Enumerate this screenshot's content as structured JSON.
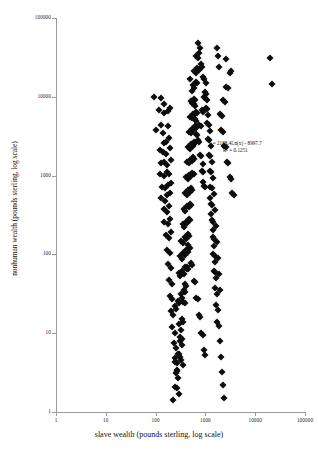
{
  "chart_data": {
    "type": "scatter",
    "title": "",
    "xlabel": "slave wealth (pounds sterling, log scale)",
    "ylabel": "nonhuman wealth (pounds sterling, log scale)",
    "xscale": "log",
    "yscale": "log",
    "xlim": [
      1,
      100000
    ],
    "ylim": [
      1,
      100000
    ],
    "xticks": [
      "1",
      "10",
      "100",
      "1000",
      "10000",
      "100000"
    ],
    "yticks": [
      "1",
      "10",
      "100",
      "1000",
      "10000",
      "100000"
    ],
    "grid": false,
    "legend": null,
    "marker": "diamond",
    "marker_color": "#0d0d0d",
    "annotations": [
      {
        "name": "regression-equation",
        "line1": "y = 2188.4Ln(x) - 8997.7",
        "line2": "R² = 0.1251",
        "x": 4000,
        "y": 2300
      }
    ],
    "regression": {
      "equation": "y = 2188.4Ln(x) - 8997.7",
      "slope_coefficient": 2188.4,
      "intercept": -8997.7,
      "r_squared": 0.1251,
      "form": "logarithmic"
    },
    "points": [
      [
        900,
        1400
      ],
      [
        900,
        830
      ],
      [
        95,
        9800
      ],
      [
        130,
        9600
      ],
      [
        150,
        8200
      ],
      [
        115,
        6800
      ],
      [
        150,
        6300
      ],
      [
        175,
        6600
      ],
      [
        195,
        7300
      ],
      [
        100,
        3800
      ],
      [
        130,
        4400
      ],
      [
        140,
        3500
      ],
      [
        175,
        4200
      ],
      [
        150,
        2600
      ],
      [
        165,
        2700
      ],
      [
        185,
        3000
      ],
      [
        120,
        2100
      ],
      [
        138,
        2000
      ],
      [
        160,
        1900
      ],
      [
        195,
        2250
      ],
      [
        128,
        1450
      ],
      [
        150,
        1500
      ],
      [
        170,
        1380
      ],
      [
        205,
        1600
      ],
      [
        120,
        1050
      ],
      [
        145,
        980
      ],
      [
        168,
        1120
      ],
      [
        190,
        1050
      ],
      [
        135,
        720
      ],
      [
        158,
        690
      ],
      [
        178,
        760
      ],
      [
        200,
        810
      ],
      [
        130,
        520
      ],
      [
        152,
        480
      ],
      [
        172,
        560
      ],
      [
        196,
        600
      ],
      [
        145,
        380
      ],
      [
        168,
        350
      ],
      [
        188,
        410
      ],
      [
        150,
        260
      ],
      [
        175,
        240
      ],
      [
        198,
        280
      ],
      [
        160,
        175
      ],
      [
        182,
        160
      ],
      [
        205,
        190
      ],
      [
        170,
        115
      ],
      [
        192,
        105
      ],
      [
        180,
        75
      ],
      [
        200,
        68
      ],
      [
        185,
        48
      ],
      [
        210,
        42
      ],
      [
        195,
        30
      ],
      [
        215,
        27
      ],
      [
        205,
        19
      ],
      [
        228,
        17
      ],
      [
        218,
        12
      ],
      [
        240,
        10
      ],
      [
        230,
        7.5
      ],
      [
        252,
        6.5
      ],
      [
        242,
        4.8
      ],
      [
        265,
        4.2
      ],
      [
        255,
        3.1
      ],
      [
        278,
        2.7
      ],
      [
        268,
        2.0
      ],
      [
        290,
        1.7
      ],
      [
        300,
        13
      ],
      [
        320,
        11
      ],
      [
        310,
        8
      ],
      [
        335,
        7
      ],
      [
        250,
        4.3
      ],
      [
        270,
        3.4
      ],
      [
        285,
        5.5
      ],
      [
        305,
        5.0
      ],
      [
        330,
        4.6
      ],
      [
        355,
        4.0
      ],
      [
        240,
        22
      ],
      [
        262,
        20
      ],
      [
        280,
        26
      ],
      [
        300,
        24
      ],
      [
        320,
        31
      ],
      [
        345,
        28
      ],
      [
        365,
        35
      ],
      [
        390,
        33
      ],
      [
        290,
        58
      ],
      [
        315,
        53
      ],
      [
        340,
        62
      ],
      [
        368,
        57
      ],
      [
        395,
        70
      ],
      [
        420,
        66
      ],
      [
        310,
        95
      ],
      [
        335,
        88
      ],
      [
        360,
        105
      ],
      [
        388,
        98
      ],
      [
        415,
        115
      ],
      [
        445,
        108
      ],
      [
        330,
        150
      ],
      [
        356,
        140
      ],
      [
        382,
        165
      ],
      [
        410,
        155
      ],
      [
        440,
        180
      ],
      [
        470,
        170
      ],
      [
        350,
        240
      ],
      [
        378,
        225
      ],
      [
        405,
        260
      ],
      [
        435,
        248
      ],
      [
        465,
        285
      ],
      [
        498,
        270
      ],
      [
        370,
        380
      ],
      [
        398,
        360
      ],
      [
        428,
        410
      ],
      [
        458,
        395
      ],
      [
        490,
        440
      ],
      [
        525,
        425
      ],
      [
        390,
        600
      ],
      [
        420,
        575
      ],
      [
        450,
        650
      ],
      [
        482,
        625
      ],
      [
        515,
        690
      ],
      [
        550,
        665
      ],
      [
        410,
        950
      ],
      [
        442,
        910
      ],
      [
        474,
        1020
      ],
      [
        508,
        980
      ],
      [
        542,
        1080
      ],
      [
        578,
        1040
      ],
      [
        430,
        1500
      ],
      [
        462,
        1440
      ],
      [
        496,
        1600
      ],
      [
        530,
        1550
      ],
      [
        566,
        1700
      ],
      [
        602,
        1640
      ],
      [
        450,
        2300
      ],
      [
        484,
        2200
      ],
      [
        518,
        2500
      ],
      [
        554,
        2400
      ],
      [
        590,
        2700
      ],
      [
        628,
        2600
      ],
      [
        470,
        3600
      ],
      [
        504,
        3450
      ],
      [
        540,
        3900
      ],
      [
        576,
        3750
      ],
      [
        614,
        4200
      ],
      [
        652,
        4050
      ],
      [
        490,
        5600
      ],
      [
        526,
        5400
      ],
      [
        562,
        6100
      ],
      [
        600,
        5900
      ],
      [
        638,
        6500
      ],
      [
        678,
        6300
      ],
      [
        510,
        8800
      ],
      [
        548,
        8400
      ],
      [
        586,
        9500
      ],
      [
        626,
        9200
      ],
      [
        560,
        14000
      ],
      [
        600,
        13000
      ],
      [
        640,
        15500
      ],
      [
        682,
        14800
      ],
      [
        600,
        21000
      ],
      [
        645,
        20000
      ],
      [
        690,
        23000
      ],
      [
        735,
        22000
      ],
      [
        660,
        33000
      ],
      [
        710,
        31000
      ],
      [
        760,
        36000
      ],
      [
        700,
        48000
      ],
      [
        780,
        42000
      ],
      [
        820,
        26000
      ],
      [
        870,
        24000
      ],
      [
        900,
        18000
      ],
      [
        950,
        17000
      ],
      [
        980,
        11500
      ],
      [
        1040,
        11000
      ],
      [
        1020,
        7200
      ],
      [
        1080,
        6900
      ],
      [
        1100,
        4600
      ],
      [
        1160,
        4400
      ],
      [
        1140,
        2900
      ],
      [
        1200,
        2800
      ],
      [
        1180,
        1850
      ],
      [
        1250,
        1780
      ],
      [
        1220,
        1150
      ],
      [
        1290,
        1100
      ],
      [
        1260,
        720
      ],
      [
        1330,
        690
      ],
      [
        1300,
        440
      ],
      [
        1380,
        420
      ],
      [
        1350,
        270
      ],
      [
        1430,
        260
      ],
      [
        1400,
        165
      ],
      [
        1480,
        158
      ],
      [
        1450,
        100
      ],
      [
        1530,
        96
      ],
      [
        1500,
        62
      ],
      [
        1590,
        59
      ],
      [
        1560,
        38
      ],
      [
        1630,
        23
      ],
      [
        1700,
        14
      ],
      [
        2100,
        3800
      ],
      [
        2250,
        3600
      ],
      [
        2400,
        2400
      ],
      [
        2550,
        2300
      ],
      [
        2700,
        1500
      ],
      [
        2900,
        1440
      ],
      [
        3100,
        950
      ],
      [
        3300,
        910
      ],
      [
        3500,
        600
      ],
      [
        3750,
        575
      ],
      [
        2000,
        6000
      ],
      [
        2150,
        5700
      ],
      [
        2300,
        9000
      ],
      [
        2480,
        8600
      ],
      [
        2650,
        13500
      ],
      [
        2850,
        13000
      ],
      [
        3050,
        20000
      ],
      [
        1900,
        24000
      ],
      [
        1800,
        33000
      ],
      [
        1700,
        42000
      ],
      [
        2600,
        30000
      ],
      [
        3200,
        21000
      ],
      [
        20000,
        31000
      ],
      [
        22000,
        14500
      ],
      [
        700,
        2800
      ],
      [
        740,
        2700
      ],
      [
        780,
        1800
      ],
      [
        820,
        1750
      ],
      [
        860,
        1150
      ],
      [
        905,
        1100
      ],
      [
        950,
        740
      ],
      [
        1000,
        710
      ],
      [
        640,
        3400
      ],
      [
        680,
        3250
      ],
      [
        620,
        5200
      ],
      [
        660,
        5000
      ],
      [
        580,
        8000
      ],
      [
        615,
        7700
      ],
      [
        540,
        12000
      ],
      [
        500,
        17000
      ],
      [
        760,
        4400
      ],
      [
        800,
        4200
      ],
      [
        840,
        6800
      ],
      [
        885,
        6500
      ],
      [
        930,
        10000
      ],
      [
        980,
        9600
      ],
      [
        1030,
        15000
      ],
      [
        1090,
        9000
      ],
      [
        1150,
        5800
      ],
      [
        1210,
        3700
      ],
      [
        1270,
        2350
      ],
      [
        1340,
        1480
      ],
      [
        1410,
        930
      ],
      [
        1480,
        590
      ],
      [
        1550,
        370
      ],
      [
        1620,
        230
      ],
      [
        1690,
        145
      ],
      [
        1760,
        90
      ],
      [
        1840,
        56
      ],
      [
        1920,
        35
      ],
      [
        450,
        130
      ],
      [
        480,
        120
      ],
      [
        510,
        78
      ],
      [
        545,
        74
      ],
      [
        580,
        46
      ],
      [
        618,
        44
      ],
      [
        655,
        28
      ],
      [
        698,
        27
      ],
      [
        740,
        17
      ],
      [
        788,
        16
      ],
      [
        835,
        10
      ],
      [
        888,
        9.5
      ],
      [
        940,
        6.2
      ],
      [
        1000,
        5.3
      ],
      [
        420,
        70
      ],
      [
        448,
        66
      ],
      [
        390,
        42
      ],
      [
        415,
        40
      ],
      [
        360,
        25
      ],
      [
        384,
        24
      ],
      [
        336,
        15
      ],
      [
        358,
        14
      ],
      [
        312,
        9
      ],
      [
        332,
        8.5
      ],
      [
        290,
        5.5
      ],
      [
        268,
        3.3
      ],
      [
        248,
        2.1
      ],
      [
        228,
        1.4
      ],
      [
        1250,
        520
      ],
      [
        1320,
        330
      ],
      [
        1390,
        205
      ],
      [
        1460,
        128
      ],
      [
        1530,
        80
      ],
      [
        1600,
        50
      ],
      [
        1680,
        31
      ],
      [
        1760,
        19.5
      ],
      [
        1850,
        12.5
      ],
      [
        1950,
        8
      ],
      [
        2050,
        5
      ],
      [
        2160,
        3.2
      ],
      [
        2280,
        2.2
      ],
      [
        2400,
        1.5
      ]
    ]
  }
}
